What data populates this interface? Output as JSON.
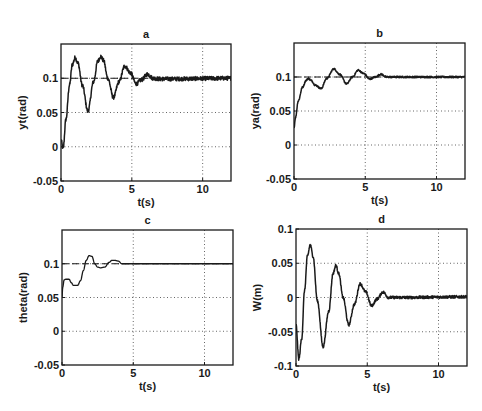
{
  "figure": {
    "background": "#ffffff",
    "line_color": "#1a1a1a",
    "grid_color": "#555555"
  },
  "chart_data": [
    {
      "id": "a",
      "type": "line",
      "title": "a",
      "xlabel": "t(s)",
      "ylabel": "yt(rad)",
      "xlim": [
        0,
        12
      ],
      "ylim": [
        -0.05,
        0.15
      ],
      "xticks": [
        0,
        5,
        10
      ],
      "yticks": [
        -0.05,
        0,
        0.05,
        0.1
      ],
      "ytick_labels": [
        "-0.05",
        "0",
        "0.05",
        "0.1"
      ],
      "grid": true,
      "reference_line": 0.1,
      "noise": 0.003,
      "box": {
        "left": 61,
        "top": 44,
        "right": 231,
        "bottom": 181
      },
      "series": [
        {
          "name": "yt",
          "x": [
            0,
            0.15,
            0.35,
            0.6,
            0.8,
            1.0,
            1.2,
            1.5,
            1.9,
            2.3,
            2.6,
            2.8,
            3.0,
            3.3,
            3.7,
            4.1,
            4.5,
            4.9,
            5.3,
            5.7,
            6.1,
            6.5,
            7.0,
            12
          ],
          "y": [
            0.01,
            -0.003,
            0.04,
            0.09,
            0.12,
            0.13,
            0.122,
            0.09,
            0.052,
            0.095,
            0.125,
            0.132,
            0.126,
            0.1,
            0.072,
            0.095,
            0.118,
            0.108,
            0.092,
            0.098,
            0.106,
            0.1,
            0.099,
            0.1
          ]
        }
      ]
    },
    {
      "id": "b",
      "type": "line",
      "title": "b",
      "xlabel": "t(s)",
      "ylabel": "ya(rad)",
      "xlim": [
        0,
        12
      ],
      "ylim": [
        -0.05,
        0.15
      ],
      "xticks": [
        0,
        5,
        10
      ],
      "yticks": [
        -0.05,
        0,
        0.05,
        0.1
      ],
      "ytick_labels": [
        "-0.05",
        "0",
        "0.05",
        "0.1"
      ],
      "grid": true,
      "reference_line": 0.1,
      "noise": 0.0012,
      "box": {
        "left": 294,
        "top": 43,
        "right": 465,
        "bottom": 179
      },
      "series": [
        {
          "name": "ya",
          "x": [
            0,
            0.1,
            0.3,
            0.6,
            0.85,
            1.0,
            1.2,
            1.5,
            1.9,
            2.3,
            2.8,
            3.2,
            3.7,
            4.1,
            4.5,
            4.9,
            5.3,
            5.7,
            6.1,
            6.5,
            7.0,
            12
          ],
          "y": [
            0.025,
            0.04,
            0.065,
            0.085,
            0.095,
            0.098,
            0.095,
            0.088,
            0.083,
            0.098,
            0.112,
            0.104,
            0.09,
            0.1,
            0.11,
            0.105,
            0.097,
            0.1,
            0.104,
            0.1,
            0.1,
            0.1
          ]
        }
      ]
    },
    {
      "id": "c",
      "type": "line",
      "title": "c",
      "xlabel": "t(s)",
      "ylabel": "theta(rad)",
      "xlim": [
        0,
        12
      ],
      "ylim": [
        -0.05,
        0.15
      ],
      "xticks": [
        0,
        5,
        10
      ],
      "yticks": [
        -0.05,
        0,
        0.05,
        0.1
      ],
      "ytick_labels": [
        "-0.05",
        "0",
        "0.05",
        "0.1"
      ],
      "grid": true,
      "reference_line": 0.1,
      "noise": 0,
      "box": {
        "left": 62,
        "top": 230,
        "right": 233,
        "bottom": 365
      },
      "series": [
        {
          "name": "theta",
          "x": [
            0,
            0.05,
            0.15,
            0.25,
            0.5,
            0.65,
            0.8,
            1.1,
            1.3,
            1.5,
            1.7,
            1.9,
            2.1,
            2.3,
            2.5,
            2.7,
            3.0,
            3.3,
            3.5,
            3.7,
            3.95,
            4.2,
            4.5,
            12
          ],
          "y": [
            0.05,
            0.065,
            0.076,
            0.077,
            0.077,
            0.072,
            0.068,
            0.068,
            0.075,
            0.09,
            0.105,
            0.112,
            0.111,
            0.1,
            0.095,
            0.094,
            0.095,
            0.102,
            0.105,
            0.105,
            0.104,
            0.1,
            0.1,
            0.1
          ]
        }
      ]
    },
    {
      "id": "d",
      "type": "line",
      "title": "d",
      "xlabel": "t(s)",
      "ylabel": "W(m)",
      "xlim": [
        0,
        12
      ],
      "ylim": [
        -0.1,
        0.1
      ],
      "xticks": [
        0,
        5,
        10
      ],
      "yticks": [
        -0.1,
        -0.05,
        0,
        0.05,
        0.1
      ],
      "ytick_labels": [
        "-0.1",
        "-0.05",
        "0",
        "0.05",
        "0.1"
      ],
      "grid": true,
      "reference_line": null,
      "noise": 0.002,
      "box": {
        "left": 296,
        "top": 229,
        "right": 467,
        "bottom": 366
      },
      "series": [
        {
          "name": "W",
          "x": [
            0,
            0.2,
            0.4,
            0.6,
            0.8,
            1.0,
            1.2,
            1.5,
            1.9,
            2.3,
            2.6,
            2.8,
            3.0,
            3.3,
            3.7,
            4.1,
            4.5,
            4.9,
            5.3,
            5.7,
            6.1,
            6.5,
            7.0,
            12
          ],
          "y": [
            -0.04,
            -0.09,
            -0.06,
            0.01,
            0.06,
            0.077,
            0.06,
            -0.005,
            -0.072,
            -0.02,
            0.035,
            0.047,
            0.035,
            0.0,
            -0.04,
            -0.01,
            0.02,
            0.008,
            -0.012,
            -0.002,
            0.008,
            0.0,
            0.0,
            0.001
          ]
        }
      ]
    }
  ]
}
